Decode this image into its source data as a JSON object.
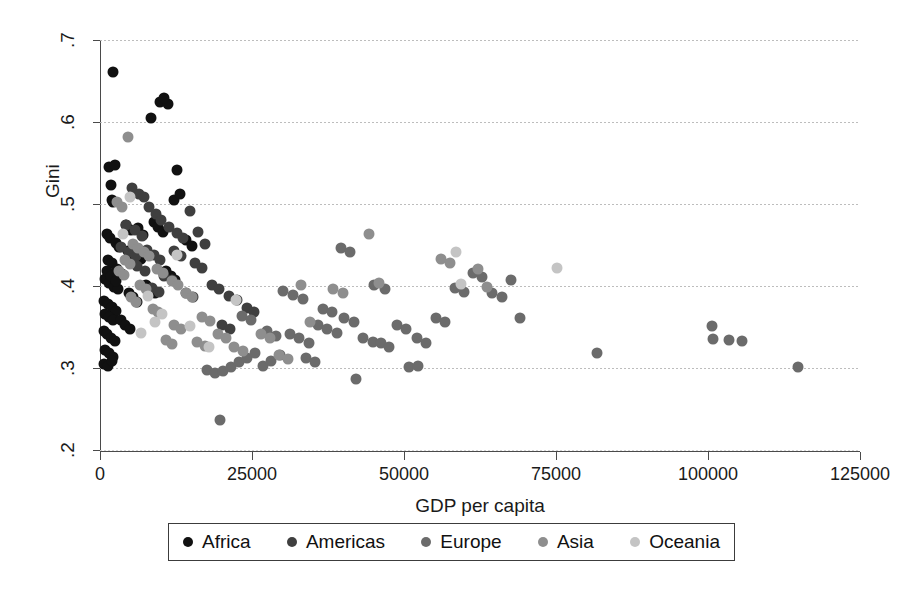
{
  "chart_data": {
    "type": "scatter",
    "title": "",
    "xlabel": "GDP per capita",
    "ylabel": "Gini",
    "xlim": [
      0,
      125000
    ],
    "ylim": [
      0.2,
      0.7
    ],
    "xticks": [
      0,
      25000,
      50000,
      75000,
      100000,
      125000
    ],
    "xtick_labels": [
      "0",
      "25000",
      "50000",
      "75000",
      "100000",
      "125000"
    ],
    "yticks": [
      0.2,
      0.3,
      0.4,
      0.5,
      0.6,
      0.7
    ],
    "ytick_labels": [
      ".2",
      ".3",
      ".4",
      ".5",
      ".6",
      ".7"
    ],
    "grid": "horizontal dotted gridlines at each y tick",
    "legend_position": "below plot, horizontal, boxed",
    "series": [
      {
        "name": "Africa",
        "color": "#111111",
        "points": [
          [
            2100,
            0.661
          ],
          [
            1500,
            0.545
          ],
          [
            2400,
            0.548
          ],
          [
            1800,
            0.523
          ],
          [
            1900,
            0.505
          ],
          [
            2200,
            0.503
          ],
          [
            9800,
            0.625
          ],
          [
            11200,
            0.622
          ],
          [
            10600,
            0.629
          ],
          [
            8400,
            0.605
          ],
          [
            1200,
            0.463
          ],
          [
            1600,
            0.458
          ],
          [
            2600,
            0.452
          ],
          [
            3100,
            0.447
          ],
          [
            1300,
            0.432
          ],
          [
            2000,
            0.428
          ],
          [
            2800,
            0.421
          ],
          [
            3600,
            0.415
          ],
          [
            900,
            0.408
          ],
          [
            1500,
            0.404
          ],
          [
            2300,
            0.399
          ],
          [
            3000,
            0.396
          ],
          [
            1100,
            0.418
          ],
          [
            1750,
            0.412
          ],
          [
            2550,
            0.406
          ],
          [
            700,
            0.382
          ],
          [
            1250,
            0.378
          ],
          [
            1950,
            0.374
          ],
          [
            2700,
            0.369
          ],
          [
            820,
            0.366
          ],
          [
            1400,
            0.362
          ],
          [
            2150,
            0.358
          ],
          [
            650,
            0.345
          ],
          [
            1150,
            0.341
          ],
          [
            1850,
            0.337
          ],
          [
            2450,
            0.333
          ],
          [
            900,
            0.322
          ],
          [
            1500,
            0.318
          ],
          [
            2100,
            0.313
          ],
          [
            700,
            0.305
          ],
          [
            1300,
            0.302
          ],
          [
            2000,
            0.309
          ],
          [
            4200,
            0.475
          ],
          [
            5100,
            0.468
          ],
          [
            4600,
            0.443
          ],
          [
            5600,
            0.437
          ],
          [
            6200,
            0.471
          ],
          [
            7100,
            0.462
          ],
          [
            6700,
            0.433
          ],
          [
            8900,
            0.478
          ],
          [
            9600,
            0.472
          ],
          [
            10400,
            0.466
          ],
          [
            12200,
            0.505
          ],
          [
            13100,
            0.512
          ],
          [
            12600,
            0.541
          ],
          [
            4800,
            0.392
          ],
          [
            5400,
            0.386
          ],
          [
            6100,
            0.381
          ],
          [
            3400,
            0.358
          ],
          [
            4100,
            0.352
          ],
          [
            5000,
            0.347
          ],
          [
            7600,
            0.401
          ],
          [
            8300,
            0.396
          ],
          [
            9100,
            0.391
          ],
          [
            10800,
            0.418
          ],
          [
            11600,
            0.412
          ],
          [
            12400,
            0.407
          ],
          [
            14200,
            0.456
          ],
          [
            15100,
            0.449
          ]
        ]
      },
      {
        "name": "Americas",
        "color": "#3f3f3f",
        "points": [
          [
            5200,
            0.519
          ],
          [
            6400,
            0.512
          ],
          [
            7300,
            0.508
          ],
          [
            8100,
            0.496
          ],
          [
            9200,
            0.488
          ],
          [
            10100,
            0.481
          ],
          [
            4300,
            0.475
          ],
          [
            5800,
            0.468
          ],
          [
            6900,
            0.461
          ],
          [
            11400,
            0.472
          ],
          [
            12700,
            0.465
          ],
          [
            13600,
            0.458
          ],
          [
            14800,
            0.491
          ],
          [
            16100,
            0.466
          ],
          [
            17200,
            0.451
          ],
          [
            3500,
            0.448
          ],
          [
            4700,
            0.441
          ],
          [
            5900,
            0.436
          ],
          [
            7800,
            0.444
          ],
          [
            8800,
            0.438
          ],
          [
            9900,
            0.432
          ],
          [
            12100,
            0.443
          ],
          [
            13300,
            0.437
          ],
          [
            15600,
            0.428
          ],
          [
            16800,
            0.422
          ],
          [
            6100,
            0.424
          ],
          [
            7400,
            0.418
          ],
          [
            18400,
            0.401
          ],
          [
            19600,
            0.396
          ],
          [
            10600,
            0.412
          ],
          [
            11900,
            0.407
          ],
          [
            21200,
            0.388
          ],
          [
            22600,
            0.383
          ],
          [
            8600,
            0.398
          ],
          [
            9700,
            0.393
          ],
          [
            24100,
            0.373
          ],
          [
            25400,
            0.368
          ],
          [
            14100,
            0.391
          ],
          [
            15300,
            0.386
          ],
          [
            20100,
            0.352
          ],
          [
            21400,
            0.347
          ]
        ]
      },
      {
        "name": "Europe",
        "color": "#6b6b6b",
        "points": [
          [
            19800,
            0.236
          ],
          [
            17600,
            0.298
          ],
          [
            18900,
            0.294
          ],
          [
            20200,
            0.296
          ],
          [
            21500,
            0.301
          ],
          [
            22800,
            0.307
          ],
          [
            24100,
            0.312
          ],
          [
            25500,
            0.318
          ],
          [
            26800,
            0.302
          ],
          [
            28200,
            0.309
          ],
          [
            29600,
            0.316
          ],
          [
            31200,
            0.341
          ],
          [
            32800,
            0.336
          ],
          [
            34300,
            0.331
          ],
          [
            35900,
            0.352
          ],
          [
            37400,
            0.347
          ],
          [
            38900,
            0.343
          ],
          [
            30100,
            0.394
          ],
          [
            31800,
            0.389
          ],
          [
            33400,
            0.384
          ],
          [
            40200,
            0.361
          ],
          [
            41800,
            0.356
          ],
          [
            43300,
            0.337
          ],
          [
            44900,
            0.332
          ],
          [
            36600,
            0.372
          ],
          [
            38100,
            0.368
          ],
          [
            46200,
            0.331
          ],
          [
            47600,
            0.326
          ],
          [
            42100,
            0.286
          ],
          [
            48900,
            0.352
          ],
          [
            50400,
            0.347
          ],
          [
            45100,
            0.401
          ],
          [
            46800,
            0.396
          ],
          [
            52100,
            0.336
          ],
          [
            53600,
            0.331
          ],
          [
            55200,
            0.361
          ],
          [
            56800,
            0.356
          ],
          [
            58400,
            0.398
          ],
          [
            59900,
            0.393
          ],
          [
            61400,
            0.416
          ],
          [
            62900,
            0.411
          ],
          [
            64500,
            0.392
          ],
          [
            66100,
            0.387
          ],
          [
            67600,
            0.407
          ],
          [
            69100,
            0.361
          ],
          [
            27400,
            0.345
          ],
          [
            28900,
            0.339
          ],
          [
            23400,
            0.363
          ],
          [
            24800,
            0.358
          ],
          [
            33900,
            0.312
          ],
          [
            35400,
            0.307
          ],
          [
            50800,
            0.301
          ],
          [
            52300,
            0.303
          ],
          [
            81800,
            0.318
          ],
          [
            100600,
            0.351
          ],
          [
            100900,
            0.335
          ],
          [
            103400,
            0.334
          ],
          [
            105600,
            0.333
          ],
          [
            114800,
            0.301
          ],
          [
            39600,
            0.446
          ],
          [
            41200,
            0.441
          ]
        ]
      },
      {
        "name": "Asia",
        "color": "#8e8e8e",
        "points": [
          [
            2800,
            0.502
          ],
          [
            3600,
            0.496
          ],
          [
            5400,
            0.451
          ],
          [
            6300,
            0.446
          ],
          [
            4100,
            0.432
          ],
          [
            5000,
            0.427
          ],
          [
            7200,
            0.441
          ],
          [
            8100,
            0.436
          ],
          [
            3200,
            0.418
          ],
          [
            4000,
            0.413
          ],
          [
            9400,
            0.421
          ],
          [
            10300,
            0.416
          ],
          [
            6600,
            0.401
          ],
          [
            7500,
            0.396
          ],
          [
            11800,
            0.406
          ],
          [
            12900,
            0.401
          ],
          [
            5100,
            0.386
          ],
          [
            5900,
            0.381
          ],
          [
            14100,
            0.391
          ],
          [
            15200,
            0.386
          ],
          [
            8700,
            0.372
          ],
          [
            9600,
            0.368
          ],
          [
            16800,
            0.362
          ],
          [
            18100,
            0.357
          ],
          [
            12200,
            0.352
          ],
          [
            13400,
            0.347
          ],
          [
            19400,
            0.341
          ],
          [
            20700,
            0.336
          ],
          [
            15900,
            0.332
          ],
          [
            17200,
            0.327
          ],
          [
            22100,
            0.326
          ],
          [
            23500,
            0.321
          ],
          [
            10900,
            0.334
          ],
          [
            11800,
            0.329
          ],
          [
            26400,
            0.341
          ],
          [
            27900,
            0.336
          ],
          [
            29400,
            0.316
          ],
          [
            30900,
            0.311
          ],
          [
            44200,
            0.464
          ],
          [
            45900,
            0.404
          ],
          [
            56100,
            0.433
          ],
          [
            57600,
            0.428
          ],
          [
            62100,
            0.421
          ],
          [
            63700,
            0.399
          ],
          [
            4600,
            0.582
          ],
          [
            38400,
            0.396
          ],
          [
            39900,
            0.391
          ],
          [
            33100,
            0.401
          ],
          [
            34600,
            0.356
          ]
        ]
      },
      {
        "name": "Oceania",
        "color": "#c4c4c4",
        "points": [
          [
            4900,
            0.509
          ],
          [
            12600,
            0.438
          ],
          [
            3800,
            0.464
          ],
          [
            7900,
            0.388
          ],
          [
            10200,
            0.366
          ],
          [
            14800,
            0.351
          ],
          [
            17900,
            0.326
          ],
          [
            22400,
            0.383
          ],
          [
            58600,
            0.441
          ],
          [
            59400,
            0.402
          ],
          [
            75200,
            0.422
          ],
          [
            6800,
            0.343
          ],
          [
            9100,
            0.356
          ]
        ]
      }
    ]
  },
  "legend": {
    "items": [
      {
        "label": "Africa",
        "color": "#111111"
      },
      {
        "label": "Americas",
        "color": "#3f3f3f"
      },
      {
        "label": "Europe",
        "color": "#6b6b6b"
      },
      {
        "label": "Asia",
        "color": "#8e8e8e"
      },
      {
        "label": "Oceania",
        "color": "#c4c4c4"
      }
    ]
  }
}
